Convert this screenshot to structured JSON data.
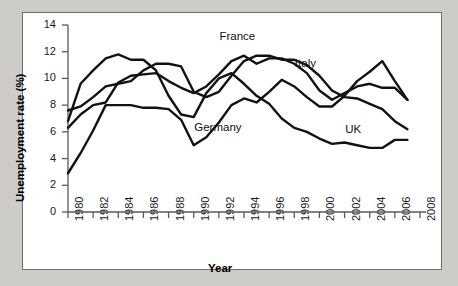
{
  "chart_data": {
    "type": "line",
    "title": "",
    "xlabel": "Year",
    "ylabel": "Unemployment rate (%)",
    "xlim": [
      1980,
      2008
    ],
    "ylim": [
      0,
      14
    ],
    "xticks": [
      1980,
      1982,
      1984,
      1986,
      1988,
      1990,
      1992,
      1994,
      1996,
      1998,
      2000,
      2002,
      2004,
      2006,
      2008
    ],
    "yticks": [
      0,
      2,
      4,
      6,
      8,
      10,
      12,
      14
    ],
    "xtick_labels": [
      "1980",
      "1982",
      "1984",
      "1986",
      "1988",
      "1990",
      "1992",
      "1994",
      "1996",
      "1998",
      "2000",
      "2002",
      "2004",
      "2006",
      "2008"
    ],
    "ytick_labels": [
      "0",
      "2",
      "4",
      "6",
      "8",
      "10",
      "12",
      "14"
    ],
    "grid": false,
    "legend_position": "inline-annotations",
    "x": [
      1980,
      1981,
      1982,
      1983,
      1984,
      1985,
      1986,
      1987,
      1988,
      1989,
      1990,
      1991,
      1992,
      1993,
      1994,
      1995,
      1996,
      1997,
      1998,
      1999,
      2000,
      2001,
      2002,
      2003,
      2004,
      2005,
      2006,
      2007
    ],
    "series": [
      {
        "name": "France",
        "label": "France",
        "values": [
          6.3,
          7.3,
          8.0,
          8.2,
          9.7,
          10.2,
          10.3,
          10.4,
          9.8,
          9.3,
          8.9,
          9.4,
          10.3,
          11.3,
          11.7,
          11.1,
          11.5,
          11.5,
          11.1,
          10.4,
          9.1,
          8.4,
          8.9,
          9.4,
          9.6,
          9.3,
          9.3,
          8.4
        ],
        "annotation": {
          "text": "France",
          "x": 1993,
          "y": 13.0
        }
      },
      {
        "name": "Italy",
        "label": "Italy",
        "values": [
          7.6,
          7.9,
          8.6,
          9.4,
          9.6,
          9.8,
          10.6,
          11.1,
          11.1,
          10.9,
          9.0,
          8.6,
          9.0,
          10.2,
          11.3,
          11.7,
          11.7,
          11.4,
          11.4,
          11.0,
          10.2,
          9.1,
          8.6,
          8.5,
          8.1,
          7.7,
          6.8,
          6.2
        ],
        "annotation": {
          "text": "Italy",
          "x": 1999,
          "y": 11.0
        }
      },
      {
        "name": "Germany",
        "label": "Germany",
        "values": [
          2.9,
          4.4,
          6.1,
          8.0,
          8.0,
          8.0,
          7.8,
          7.8,
          7.7,
          6.9,
          5.0,
          5.6,
          6.7,
          8.0,
          8.5,
          8.2,
          9.0,
          9.9,
          9.4,
          8.6,
          7.9,
          7.9,
          8.7,
          9.8,
          10.5,
          11.3,
          9.8,
          8.4
        ],
        "annotation": {
          "text": "Germany",
          "x": 1991,
          "y": 6.2
        }
      },
      {
        "name": "UK",
        "label": "UK",
        "values": [
          6.8,
          9.6,
          10.6,
          11.5,
          11.8,
          11.4,
          11.4,
          10.6,
          8.7,
          7.3,
          7.1,
          8.9,
          10.0,
          10.4,
          9.6,
          8.7,
          8.1,
          7.0,
          6.3,
          6.0,
          5.5,
          5.1,
          5.2,
          5.0,
          4.8,
          4.8,
          5.4,
          5.4
        ],
        "annotation": {
          "text": "UK",
          "x": 2003,
          "y": 6.1
        }
      }
    ]
  },
  "axis": {
    "y_title": "Unemployment rate (%)",
    "x_title": "Year"
  }
}
